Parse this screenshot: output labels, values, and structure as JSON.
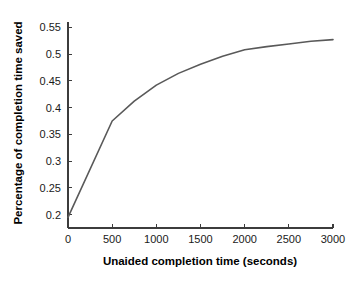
{
  "chart_data": {
    "type": "line",
    "title": "",
    "xlabel": "Unaided completion time (seconds)",
    "ylabel": "Percentage of completion time saved",
    "xlim": [
      0,
      3000
    ],
    "ylim": [
      0.175,
      0.56
    ],
    "grid": false,
    "legend": null,
    "x_ticks": [
      0,
      500,
      1000,
      1500,
      2000,
      2500,
      3000
    ],
    "x_tick_labels": [
      "0",
      "500",
      "1000",
      "1500",
      "2000",
      "2500",
      "3000"
    ],
    "y_ticks": [
      0.2,
      0.25,
      0.3,
      0.35,
      0.4,
      0.45,
      0.5,
      0.55
    ],
    "y_tick_labels": [
      "0.2",
      "0.25",
      "0.3",
      "0.35",
      "0.4",
      "0.45",
      "0.5",
      "0.55"
    ],
    "line_color": "#595959",
    "line_width": 1.6,
    "x": [
      0,
      500,
      750,
      1000,
      1250,
      1500,
      1750,
      2000,
      2250,
      2500,
      2750,
      3000
    ],
    "values": [
      0.195,
      0.375,
      0.412,
      0.442,
      0.464,
      0.481,
      0.496,
      0.508,
      0.514,
      0.519,
      0.524,
      0.527
    ],
    "series": [
      {
        "name": "Percentage of completion time saved",
        "values": [
          0.195,
          0.375,
          0.412,
          0.442,
          0.464,
          0.481,
          0.496,
          0.508,
          0.514,
          0.519,
          0.524,
          0.527
        ]
      }
    ]
  },
  "axes": {
    "x_axis_title": "Unaided completion time (seconds)",
    "y_axis_title": "Percentage of completion time saved"
  }
}
